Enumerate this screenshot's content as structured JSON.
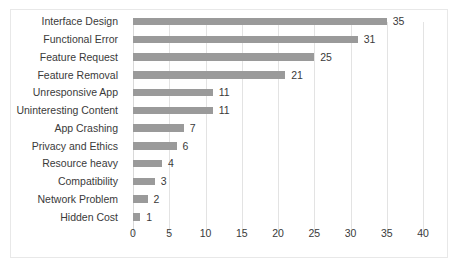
{
  "chart_data": {
    "type": "bar",
    "orientation": "horizontal",
    "title": "",
    "xlabel": "",
    "ylabel": "",
    "xlim": [
      0,
      40
    ],
    "xticks": [
      0,
      5,
      10,
      15,
      20,
      25,
      30,
      35,
      40
    ],
    "grid": true,
    "legend": false,
    "bar_color": "#9a9a9a",
    "categories": [
      "Interface Design",
      "Functional Error",
      "Feature Request",
      "Feature Removal",
      "Unresponsive App",
      "Uninteresting Content",
      "App Crashing",
      "Privacy and Ethics",
      "Resource heavy",
      "Compatibility",
      "Network Problem",
      "Hidden Cost"
    ],
    "values": [
      35,
      31,
      25,
      21,
      11,
      11,
      7,
      6,
      4,
      3,
      2,
      1
    ],
    "data_labels": [
      "35",
      "31",
      "25",
      "21",
      "11",
      "11",
      "7",
      "6",
      "4",
      "3",
      "2",
      "1"
    ],
    "tick_labels": [
      "0",
      "5",
      "10",
      "15",
      "20",
      "25",
      "30",
      "35",
      "40"
    ]
  },
  "figure": {
    "caption": ""
  }
}
